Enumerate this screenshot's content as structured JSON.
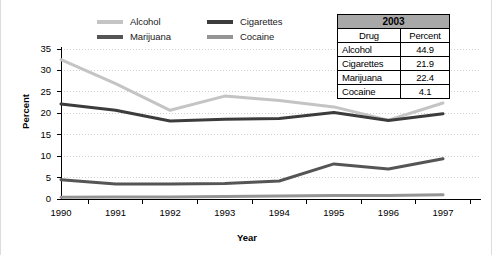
{
  "chart_data": {
    "type": "line",
    "title": "",
    "xlabel": "Year",
    "ylabel": "Percent",
    "xlim": [
      1990,
      1997
    ],
    "ylim": [
      0,
      35
    ],
    "ytick_step": 5,
    "grid": true,
    "legend_position": "top",
    "x": [
      1990,
      1991,
      1992,
      1993,
      1994,
      1995,
      1996,
      1997
    ],
    "xticks": [
      "1990",
      "1991",
      "1992",
      "1993",
      "1994",
      "1995",
      "1996",
      "1997"
    ],
    "yticks": [
      "0",
      "5",
      "10",
      "15",
      "20",
      "25",
      "30",
      "35"
    ],
    "series": [
      {
        "name": "Alcohol",
        "color": "#c4c4c4",
        "values": [
          32.5,
          26.9,
          20.7,
          24.0,
          23.0,
          21.5,
          18.4,
          22.4
        ]
      },
      {
        "name": "Cigarettes",
        "color": "#3c3c3c",
        "values": [
          22.2,
          20.7,
          18.2,
          18.6,
          18.8,
          20.2,
          18.3,
          19.9
        ]
      },
      {
        "name": "Marijuana",
        "color": "#555555",
        "values": [
          4.5,
          3.5,
          3.5,
          3.6,
          4.2,
          8.2,
          7.0,
          9.4
        ]
      },
      {
        "name": "Cocaine",
        "color": "#949494",
        "values": [
          0.4,
          0.5,
          0.5,
          0.6,
          0.7,
          0.8,
          0.8,
          1.0
        ]
      }
    ]
  },
  "legend": {
    "items": [
      {
        "label": "Alcohol",
        "color": "#c4c4c4"
      },
      {
        "label": "Cigarettes",
        "color": "#3c3c3c"
      },
      {
        "label": "Marijuana",
        "color": "#555555"
      },
      {
        "label": "Cocaine",
        "color": "#949494"
      }
    ]
  },
  "table": {
    "year_header": "2003",
    "columns": [
      "Drug",
      "Percent"
    ],
    "rows": [
      {
        "drug": "Alcohol",
        "percent": "44.9"
      },
      {
        "drug": "Cigarettes",
        "percent": "21.9"
      },
      {
        "drug": "Marijuana",
        "percent": "22.4"
      },
      {
        "drug": "Cocaine",
        "percent": "4.1"
      }
    ]
  },
  "axes": {
    "y_title": "Percent",
    "x_title": "Year"
  }
}
